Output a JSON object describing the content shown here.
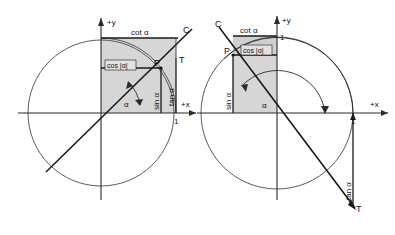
{
  "figure": {
    "colors": {
      "shade": "#cfcfcf",
      "ink": "#1a1a1a",
      "axis": "#2b2b2b",
      "circle": "#4a4a4a",
      "background": "#ffffff"
    }
  },
  "diagrams": [
    {
      "id": "left",
      "name": "first-quadrant-case",
      "axes": {
        "x_label": "+x",
        "y_label": "+y"
      },
      "tick_label": "1",
      "angle_label": "α",
      "points": {
        "P": "P",
        "T": "T",
        "C": "C"
      },
      "labels": {
        "cot": "cot α",
        "cos": "cos |α|",
        "sin": "sin α",
        "tan": "tan α"
      },
      "geometry": {
        "origin_x": 101,
        "origin_y": 113,
        "unit_radius": 75,
        "big_radius": 73,
        "alpha_degrees": 36.5,
        "P_x": 161,
        "P_y": 68
      }
    },
    {
      "id": "right",
      "name": "second-quadrant-case",
      "axes": {
        "x_label": "+x",
        "y_label": "+y"
      },
      "tick_label_x": "1",
      "tick_label_y": "1",
      "angle_label": "α",
      "points": {
        "P": "P",
        "T": "T",
        "C": "C"
      },
      "labels": {
        "cot": "cot α",
        "cos": "cos |α|",
        "sin": "sin α",
        "tan": "tan α"
      },
      "geometry": {
        "origin_x": 277,
        "origin_y": 113,
        "unit_radius": 76,
        "inner_radius": 48,
        "alpha_degrees": 127,
        "P_x": 233,
        "P_y": 55
      }
    }
  ]
}
